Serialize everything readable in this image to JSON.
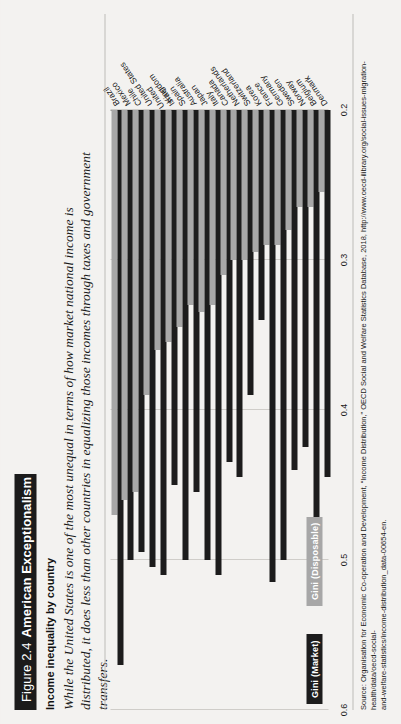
{
  "figure": {
    "label": "Figure 2.4",
    "title": "American Exceptionalism",
    "subtitle": "Income inequality by country",
    "blurb": "While the United States is one of the most unequal in terms of how market national income is distributed, it does less than other countries in equalizing those incomes through taxes and government transfers.",
    "source_line_1": "Source: Organisation for Economic Co-operation and Development, “Income Distribution,” OECD Social and Welfare Statistics Database, 2018, http://www.oecd-ilibrary.org/social-issues-migration-health/data/oecd-social-",
    "source_line_2": "and-welfare-statistics/income-distribution_data-00654-en."
  },
  "colors": {
    "market": "#1c1c1c",
    "disposable": "#a7a7a7",
    "grid": "#cfcdc9",
    "axis": "#9a9894",
    "page": "#f3f2f0",
    "title_bar": "#1b1b1b"
  },
  "legend": {
    "market_label": "Gini (Market)",
    "disposable_label": "Gini (Disposable)"
  },
  "chart_data": {
    "type": "bar",
    "orientation": "horizontal",
    "title": "Income inequality by country",
    "xlabel": "",
    "ylabel": "",
    "xlim": [
      0.2,
      0.6
    ],
    "grid": true,
    "legend_position": "bottom-left",
    "tick_labels": [
      "0.6",
      "0.5",
      "0.4",
      "0.3",
      "0.2"
    ],
    "tick_values": [
      0.6,
      0.5,
      0.4,
      0.3,
      0.2
    ],
    "categories": [
      "Brazil",
      "Mexico",
      "Chile",
      "United States",
      "United\nKingdom",
      "Israel",
      "Spain",
      "Australia",
      "Japan",
      "Italy",
      "Canada",
      "Netherlands",
      "Switzerland",
      "Korea",
      "France",
      "Germany",
      "Sweden",
      "Norway",
      "Belgium",
      "Denmark"
    ],
    "series": [
      {
        "name": "Gini (Market)",
        "color": "#1c1c1c",
        "values": [
          0.57,
          0.5,
          0.495,
          0.505,
          0.51,
          0.45,
          0.5,
          0.455,
          0.5,
          0.51,
          0.435,
          0.445,
          0.39,
          0.34,
          0.515,
          0.5,
          0.44,
          0.425,
          0.49,
          0.445
        ]
      },
      {
        "name": "Gini (Disposable)",
        "color": "#a7a7a7",
        "values": [
          0.47,
          0.46,
          0.455,
          0.39,
          0.36,
          0.355,
          0.345,
          0.33,
          0.335,
          0.33,
          0.31,
          0.3,
          0.3,
          0.295,
          0.29,
          0.29,
          0.28,
          0.265,
          0.265,
          0.255
        ]
      }
    ]
  }
}
